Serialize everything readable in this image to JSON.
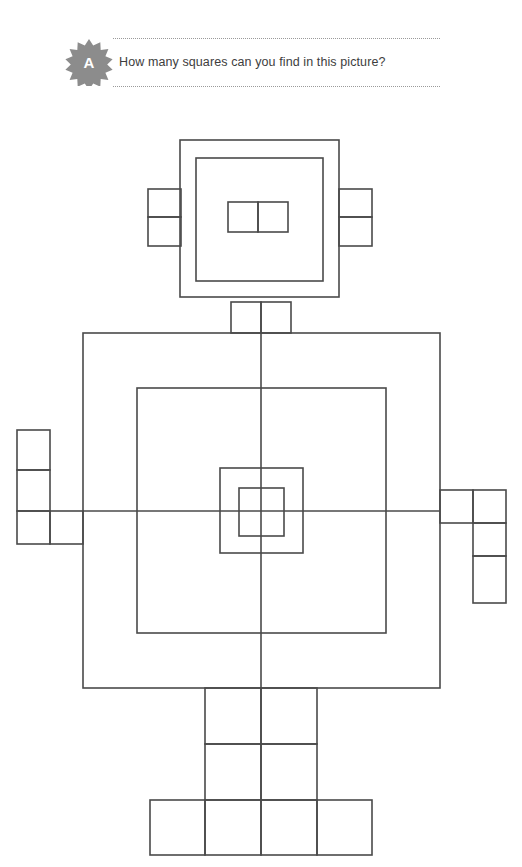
{
  "page": {
    "background_color": "#ffffff",
    "line_color": "#4a4a4a",
    "badge_color": "#8c8c8c",
    "text_color": "#3d3d3d"
  },
  "header": {
    "badge_letter": "A",
    "badge_icon": "starburst-badge-icon",
    "question": "How many squares can you find in this picture?",
    "rule_style": "dotted"
  },
  "figure": {
    "name": "robot-squares-puzzle",
    "stroke_width": 1.6,
    "parts": {
      "head_outer": {
        "x": 180,
        "y": 140,
        "w": 159,
        "h": 157
      },
      "head_inner": {
        "x": 196,
        "y": 158,
        "w": 127,
        "h": 123
      },
      "eye_left": {
        "x": 228,
        "y": 202,
        "w": 30,
        "h": 30
      },
      "eye_right": {
        "x": 258,
        "y": 202,
        "w": 30,
        "h": 30
      },
      "ear_left_top": {
        "x": 148,
        "y": 189,
        "w": 33,
        "h": 28
      },
      "ear_left_bottom": {
        "x": 148,
        "y": 217,
        "w": 33,
        "h": 29
      },
      "ear_right_top": {
        "x": 339,
        "y": 189,
        "w": 33,
        "h": 28
      },
      "ear_right_bottom": {
        "x": 339,
        "y": 217,
        "w": 33,
        "h": 29
      },
      "neck_left": {
        "x": 231,
        "y": 302,
        "w": 30,
        "h": 31
      },
      "neck_right": {
        "x": 261,
        "y": 302,
        "w": 30,
        "h": 31
      },
      "body_outer": {
        "x": 83,
        "y": 333,
        "w": 357,
        "h": 355
      },
      "body_inner": {
        "x": 137,
        "y": 388,
        "w": 249,
        "h": 245
      },
      "core_outer": {
        "x": 220,
        "y": 468,
        "w": 83,
        "h": 85
      },
      "core_inner": {
        "x": 239,
        "y": 488,
        "w": 45,
        "h": 48
      },
      "body_vertical_axis": {
        "x": 261,
        "y1": 333,
        "y2": 688
      },
      "body_horizontal_axis": {
        "y": 511,
        "x1": 83,
        "x2": 440
      },
      "arm_left_top": {
        "x": 17,
        "y": 430,
        "w": 33,
        "h": 40
      },
      "arm_left_mid": {
        "x": 17,
        "y": 470,
        "w": 33,
        "h": 41
      },
      "arm_left_low_a": {
        "x": 17,
        "y": 511,
        "w": 33,
        "h": 33
      },
      "arm_left_low_b": {
        "x": 50,
        "y": 511,
        "w": 33,
        "h": 33
      },
      "arm_right_in": {
        "x": 440,
        "y": 490,
        "w": 33,
        "h": 33
      },
      "arm_right_out_top": {
        "x": 473,
        "y": 490,
        "w": 33,
        "h": 33
      },
      "arm_right_out_mid": {
        "x": 473,
        "y": 523,
        "w": 33,
        "h": 33
      },
      "arm_right_out_low": {
        "x": 473,
        "y": 556,
        "w": 33,
        "h": 47
      },
      "leg_upper_left": {
        "x": 205,
        "y": 688,
        "w": 56,
        "h": 56
      },
      "leg_upper_right": {
        "x": 261,
        "y": 688,
        "w": 56,
        "h": 56
      },
      "leg_lower_left": {
        "x": 205,
        "y": 744,
        "w": 56,
        "h": 56
      },
      "leg_lower_right": {
        "x": 261,
        "y": 744,
        "w": 56,
        "h": 56
      },
      "foot_1": {
        "x": 150,
        "y": 800,
        "w": 55,
        "h": 55
      },
      "foot_2": {
        "x": 205,
        "y": 800,
        "w": 56,
        "h": 55
      },
      "foot_3": {
        "x": 261,
        "y": 800,
        "w": 56,
        "h": 55
      },
      "foot_4": {
        "x": 317,
        "y": 800,
        "w": 55,
        "h": 55
      }
    }
  }
}
